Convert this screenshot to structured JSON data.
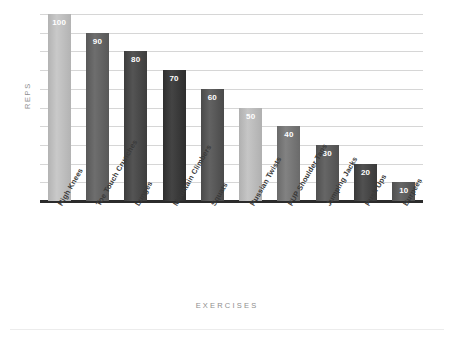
{
  "chart_data": {
    "type": "bar",
    "title": "",
    "xlabel": "EXERCISES",
    "ylabel": "REPS",
    "ylim": [
      0,
      100
    ],
    "grid": true,
    "legend": "none",
    "gridline_count": 10,
    "categories": [
      "High Knees",
      "Toe Touch Crunches",
      "Lunges",
      "Mountain Climbers",
      "Squats",
      "Russian Twists",
      "PUP Shoulder Taps",
      "Jumping Jacks",
      "Push Ups",
      "Burpees"
    ],
    "values": [
      100,
      90,
      80,
      70,
      60,
      50,
      40,
      30,
      20,
      10
    ],
    "value_labels": [
      "100",
      "90",
      "80",
      "70",
      "60",
      "50",
      "40",
      "30",
      "20",
      "10"
    ],
    "bar_colors": [
      "#b3b3b3",
      "#585858",
      "#3d3d3d",
      "#2e2e2e",
      "#4a4a4a",
      "#b0b0b0",
      "#6a6a6a",
      "#505050",
      "#3a3a3a",
      "#4f4f4f"
    ],
    "bar_colors_light": [
      "#c9c9c9",
      "#6e6e6e",
      "#545454",
      "#444444",
      "#626262",
      "#c6c6c6",
      "#828282",
      "#666666",
      "#515151",
      "#666666"
    ]
  },
  "axes": {
    "y_title": "REPS",
    "x_title": "EXERCISES",
    "baseline_color": "#2b2b2b",
    "gridline_color": "#d6d6d6"
  },
  "canvas": {
    "background": "#ffffff",
    "divider_color": "#ececec"
  }
}
